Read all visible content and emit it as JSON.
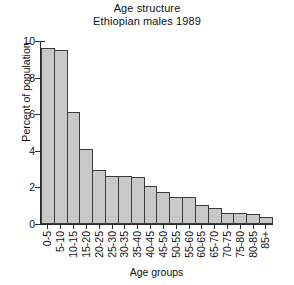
{
  "chart_data": {
    "type": "bar",
    "title": "Age structure",
    "subtitle": "Ethiopian males 1989",
    "title_lines": [
      "Age structure",
      "Ethiopian males 1989"
    ],
    "xlabel": "Age groups",
    "ylabel": "Percent of population",
    "ylim": [
      0,
      10
    ],
    "yticks": [
      0,
      2,
      4,
      6,
      8,
      10
    ],
    "ytick_labels": [
      "0",
      "2",
      "4",
      "6",
      "8",
      "10"
    ],
    "grid": false,
    "legend": null,
    "bar_color": "#c9c9c9",
    "bar_edge_color": "#3a3a3a",
    "categories": [
      "0-5",
      "5-10",
      "10-15",
      "15-20",
      "20-25",
      "25-30",
      "30-35",
      "35-40",
      "40-45",
      "45-50",
      "50-55",
      "55-60",
      "60-65",
      "65-70",
      "70-75",
      "75-80",
      "80-85",
      "85+"
    ],
    "values": [
      9.6,
      9.5,
      6.1,
      4.1,
      2.95,
      2.6,
      2.6,
      2.55,
      2.1,
      1.75,
      1.5,
      1.5,
      1.05,
      0.9,
      0.6,
      0.6,
      0.55,
      0.4
    ]
  }
}
